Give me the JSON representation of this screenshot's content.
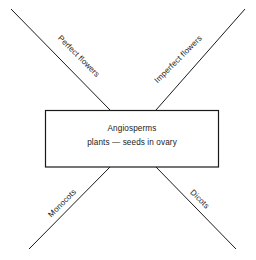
{
  "diagram": {
    "type": "classification-x-diagram",
    "center_box": {
      "title": "Angiosperms",
      "subtitle": "plants — seeds in ovary"
    },
    "branches": [
      {
        "id": "perfect-flowers",
        "label": "Perfect flowers",
        "position": "upper-left",
        "rotation_deg": 45
      },
      {
        "id": "imperfect-flowers",
        "label": "Imperfect flowers",
        "position": "upper-right",
        "rotation_deg": -45
      },
      {
        "id": "monocots",
        "label": "Monocots",
        "position": "lower-left",
        "rotation_deg": -45
      },
      {
        "id": "dicots",
        "label": "Dicots",
        "position": "lower-right",
        "rotation_deg": 45
      }
    ],
    "colors": {
      "line": "#1a1a1a",
      "text": "#1a1a1a",
      "background": "#ffffff"
    }
  }
}
